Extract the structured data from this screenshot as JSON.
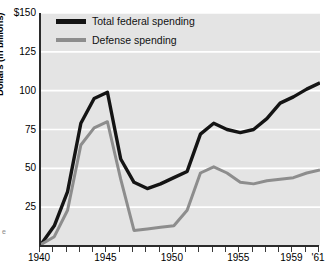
{
  "chart_data": {
    "type": "line",
    "title": "",
    "xlabel": "",
    "ylabel": "Dollars (in billions)",
    "xlim": [
      1940,
      1961
    ],
    "ylim": [
      0,
      150
    ],
    "grid": true,
    "legend_position": "top-left",
    "y_ticks": [
      150,
      125,
      100,
      75,
      50,
      25
    ],
    "y_tick_labels": [
      "$150",
      "125",
      "100",
      "75",
      "50",
      "25"
    ],
    "x_ticks": [
      1940,
      1941,
      1942,
      1943,
      1944,
      1945,
      1946,
      1947,
      1948,
      1949,
      1950,
      1951,
      1952,
      1953,
      1954,
      1955,
      1956,
      1957,
      1958,
      1959,
      1960,
      1961
    ],
    "x_tick_labels": [
      {
        "year": 1940,
        "label": "1940"
      },
      {
        "year": 1945,
        "label": "1945"
      },
      {
        "year": 1950,
        "label": "1950"
      },
      {
        "year": 1955,
        "label": "1955"
      },
      {
        "year": 1959,
        "label": "1959"
      },
      {
        "year": 1961,
        "label": "'61"
      }
    ],
    "x": [
      1940,
      1941,
      1942,
      1943,
      1944,
      1945,
      1946,
      1947,
      1948,
      1949,
      1950,
      1951,
      1952,
      1953,
      1954,
      1955,
      1956,
      1957,
      1958,
      1959,
      1960,
      1961
    ],
    "series": [
      {
        "name": "Total federal spending",
        "color": "#141414",
        "values": [
          1,
          13,
          35,
          79,
          95,
          99,
          56,
          41,
          37,
          40,
          44,
          48,
          72,
          79,
          75,
          73,
          75,
          82,
          92,
          96,
          101,
          105
        ]
      },
      {
        "name": "Defense spending",
        "color": "#8d8d8d",
        "values": [
          1,
          6,
          23,
          65,
          76,
          80,
          43,
          10,
          11,
          12,
          13,
          23,
          47,
          51,
          47,
          41,
          40,
          42,
          43,
          44,
          47,
          49
        ]
      }
    ]
  },
  "legend": {
    "items": [
      {
        "label": "Total federal spending",
        "swatch": "total"
      },
      {
        "label": "Defense spending",
        "swatch": "defense"
      }
    ]
  },
  "artifact": {
    "text": "e"
  }
}
